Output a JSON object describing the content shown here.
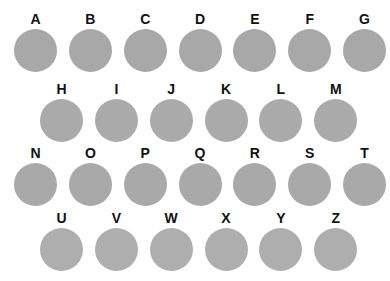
{
  "plate": {
    "background_color": "#ffffff",
    "disc_color": "#a9a9a9",
    "label_color": "#111111",
    "rows": [
      {
        "row_id": "row-1",
        "items": [
          {
            "label": "A"
          },
          {
            "label": "B"
          },
          {
            "label": "C"
          },
          {
            "label": "D"
          },
          {
            "label": "E"
          },
          {
            "label": "F"
          },
          {
            "label": "G"
          }
        ]
      },
      {
        "row_id": "row-2",
        "items": [
          {
            "label": "H"
          },
          {
            "label": "I"
          },
          {
            "label": "J"
          },
          {
            "label": "K"
          },
          {
            "label": "L"
          },
          {
            "label": "M"
          }
        ]
      },
      {
        "row_id": "row-3",
        "items": [
          {
            "label": "N"
          },
          {
            "label": "O"
          },
          {
            "label": "P"
          },
          {
            "label": "Q"
          },
          {
            "label": "R"
          },
          {
            "label": "S"
          },
          {
            "label": "T"
          }
        ]
      },
      {
        "row_id": "row-4",
        "items": [
          {
            "label": "U"
          },
          {
            "label": "V"
          },
          {
            "label": "W"
          },
          {
            "label": "X"
          },
          {
            "label": "Y"
          },
          {
            "label": "Z"
          }
        ]
      }
    ]
  }
}
